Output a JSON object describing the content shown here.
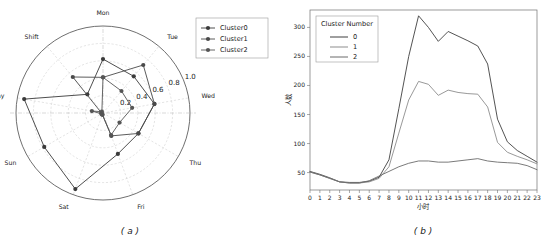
{
  "figure": {
    "panel_a_caption": "( a )",
    "panel_b_caption": "( b )"
  },
  "chart_data": [
    {
      "type": "line",
      "subtype": "radar",
      "panel": "a",
      "title": "",
      "categories": [
        "Mon",
        "Tue",
        "Wed",
        "Thu",
        "Fri",
        "Sat",
        "Sun",
        "Holiday",
        "Shift"
      ],
      "rticks": [
        0.2,
        0.4,
        0.6,
        0.8,
        1.0
      ],
      "rlim": [
        0,
        1.0
      ],
      "grid": true,
      "legend_position": "upper right",
      "series": [
        {
          "name": "Cluster0",
          "color": "#3a3a3a",
          "values": [
            0.62,
            0.55,
            0.6,
            0.47,
            0.5,
            0.93,
            0.78,
            0.92,
            0.28
          ]
        },
        {
          "name": "Cluster1",
          "color": "#4a4a4a",
          "values": [
            0.41,
            0.72,
            0.6,
            0.47,
            0.28,
            0.02,
            0.02,
            0.02,
            0.54
          ]
        },
        {
          "name": "Cluster2",
          "color": "#555555",
          "values": [
            0.41,
            0.33,
            0.34,
            0.22,
            0.27,
            0.02,
            0.02,
            0.13,
            0.02
          ]
        }
      ]
    },
    {
      "type": "line",
      "panel": "b",
      "title": "",
      "legend_title": "Cluster Number",
      "legend_position": "upper left",
      "xlabel": "小时",
      "ylabel": "人数",
      "xticks": [
        0,
        1,
        2,
        3,
        4,
        5,
        6,
        7,
        8,
        9,
        10,
        11,
        12,
        13,
        14,
        15,
        16,
        17,
        18,
        19,
        20,
        21,
        22,
        23
      ],
      "yticks": [
        50,
        100,
        150,
        200,
        250,
        300
      ],
      "xlim": [
        0,
        23
      ],
      "ylim": [
        20,
        330
      ],
      "grid": false,
      "series": [
        {
          "name": "0",
          "color": "#3f3f3f",
          "values": [
            52,
            47,
            41,
            34,
            33,
            33,
            35,
            42,
            72,
            160,
            250,
            320,
            300,
            276,
            293,
            285,
            277,
            268,
            237,
            142,
            103,
            88,
            78,
            68
          ]
        },
        {
          "name": "1",
          "color": "#8d8d8d",
          "values": [
            51,
            46,
            40,
            34,
            32,
            32,
            34,
            40,
            60,
            118,
            175,
            207,
            202,
            183,
            192,
            188,
            186,
            185,
            163,
            102,
            85,
            78,
            72,
            65
          ]
        },
        {
          "name": "2",
          "color": "#6b6b6b",
          "values": [
            51,
            46,
            40,
            34,
            32,
            32,
            36,
            44,
            52,
            60,
            66,
            70,
            70,
            68,
            68,
            70,
            72,
            74,
            70,
            68,
            67,
            66,
            62,
            55
          ]
        }
      ]
    }
  ],
  "panel_a": {
    "legend": {
      "items": [
        {
          "label": "Cluster0"
        },
        {
          "label": "Cluster1"
        },
        {
          "label": "Cluster2"
        }
      ]
    },
    "axis_labels": [
      "Mon",
      "Tue",
      "Wed",
      "Thu",
      "Fri",
      "Sat",
      "Sun",
      "Holiday",
      "Shift"
    ],
    "radial_ticks": [
      "0.2",
      "0.4",
      "0.6",
      "0.8",
      "1.0"
    ]
  },
  "panel_b": {
    "legend": {
      "title": "Cluster Number",
      "items": [
        {
          "label": "0"
        },
        {
          "label": "1"
        },
        {
          "label": "2"
        }
      ]
    },
    "xlabel": "小时",
    "ylabel": "人数",
    "ytick_labels": [
      "50",
      "100",
      "150",
      "200",
      "250",
      "300"
    ],
    "xtick_labels": [
      "0",
      "1",
      "2",
      "3",
      "4",
      "5",
      "6",
      "7",
      "8",
      "9",
      "10",
      "11",
      "12",
      "13",
      "14",
      "15",
      "16",
      "17",
      "18",
      "19",
      "20",
      "21",
      "22",
      "23"
    ]
  }
}
